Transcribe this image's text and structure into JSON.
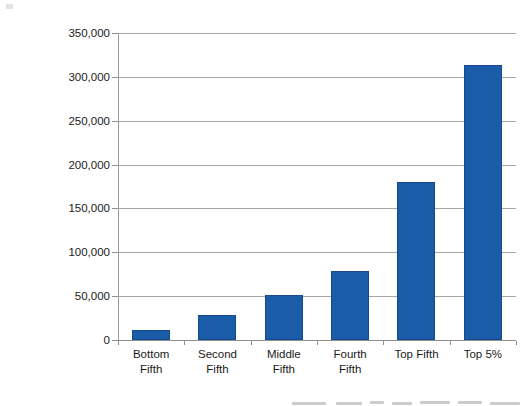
{
  "chart_data": {
    "type": "bar",
    "title": "",
    "subtitle": "",
    "xlabel": "",
    "ylabel": "Average Household Income ($)",
    "categories": [
      "Bottom Fifth",
      "Second Fifth",
      "Middle Fifth",
      "Fourth Fifth",
      "Top Fifth",
      "Top 5%"
    ],
    "category_lines": [
      [
        "Bottom",
        "Fifth"
      ],
      [
        "Second",
        "Fifth"
      ],
      [
        "Middle",
        "Fifth"
      ],
      [
        "Fourth",
        "Fifth"
      ],
      [
        "Top Fifth",
        ""
      ],
      [
        "Top 5%",
        ""
      ]
    ],
    "values": [
      11000,
      29000,
      51000,
      79000,
      180000,
      313000
    ],
    "ylim": [
      0,
      350000
    ],
    "ytick_values": [
      0,
      50000,
      100000,
      150000,
      200000,
      250000,
      300000,
      350000
    ],
    "ytick_labels": [
      "0",
      "50,000",
      "100,000",
      "150,000",
      "200,000",
      "250,000",
      "300,000",
      "350,000"
    ],
    "grid": true,
    "grid_axis": "y",
    "legend": false,
    "legend_position": "none",
    "series": [
      {
        "name": "Average Household Income",
        "values": [
          11000,
          29000,
          51000,
          79000,
          180000,
          313000
        ]
      }
    ]
  },
  "style": {
    "bar_color": "#1b5ca8",
    "bar_border_color": "#154b8c",
    "gridline_color": "#a6a6a6",
    "axis_color": "#8f8f8f",
    "text_color": "#1a1a1a",
    "background": "#ffffff"
  }
}
